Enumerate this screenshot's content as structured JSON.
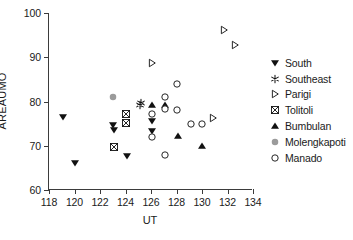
{
  "chart_data": {
    "type": "scatter",
    "title": "",
    "xlabel": "UT",
    "ylabel": "AREAUMO",
    "xlim": [
      118,
      134
    ],
    "ylim": [
      60,
      100
    ],
    "xticks": [
      118,
      120,
      122,
      124,
      126,
      128,
      130,
      132,
      134
    ],
    "yticks": [
      60,
      70,
      80,
      90,
      100
    ],
    "grid": false,
    "legend_position": "right",
    "series": [
      {
        "name": "South",
        "marker": "filled-triangle-down",
        "color": "#111111",
        "points": [
          {
            "x": 119.1,
            "y": 76.4
          },
          {
            "x": 120.0,
            "y": 66.0
          },
          {
            "x": 123.0,
            "y": 74.6
          },
          {
            "x": 123.1,
            "y": 73.6
          },
          {
            "x": 124.1,
            "y": 67.7
          },
          {
            "x": 126.1,
            "y": 75.6
          },
          {
            "x": 126.1,
            "y": 73.4
          }
        ]
      },
      {
        "name": "Southeast",
        "marker": "asterisk",
        "color": "#111111",
        "points": [
          {
            "x": 125.2,
            "y": 79.7
          },
          {
            "x": 125.1,
            "y": 79.1
          }
        ]
      },
      {
        "name": "Parigi",
        "marker": "open-triangle-right",
        "color": "#111111",
        "points": [
          {
            "x": 126.1,
            "y": 88.8
          },
          {
            "x": 130.9,
            "y": 76.3
          },
          {
            "x": 131.7,
            "y": 96.2
          },
          {
            "x": 132.6,
            "y": 92.8
          }
        ]
      },
      {
        "name": "Tolitoli",
        "marker": "crossed-square",
        "color": "#111111",
        "points": [
          {
            "x": 124.0,
            "y": 77.1
          },
          {
            "x": 124.0,
            "y": 75.1
          },
          {
            "x": 123.1,
            "y": 69.8
          }
        ]
      },
      {
        "name": "Bumbulan",
        "marker": "filled-triangle-up",
        "color": "#111111",
        "points": [
          {
            "x": 126.1,
            "y": 79.3
          },
          {
            "x": 127.1,
            "y": 79.2
          },
          {
            "x": 128.1,
            "y": 72.1
          },
          {
            "x": 130.0,
            "y": 70.0
          }
        ]
      },
      {
        "name": "Molengkapoti",
        "marker": "filled-circle-gray",
        "color": "#9b9b9b",
        "points": [
          {
            "x": 123.0,
            "y": 81.0
          }
        ]
      },
      {
        "name": "Manado",
        "marker": "open-circle",
        "color": "#111111",
        "points": [
          {
            "x": 126.1,
            "y": 77.2
          },
          {
            "x": 126.1,
            "y": 72.0
          },
          {
            "x": 127.1,
            "y": 81.0
          },
          {
            "x": 127.1,
            "y": 78.2
          },
          {
            "x": 127.1,
            "y": 68.0
          },
          {
            "x": 128.0,
            "y": 84.0
          },
          {
            "x": 128.0,
            "y": 78.0
          },
          {
            "x": 129.1,
            "y": 75.0
          },
          {
            "x": 130.0,
            "y": 75.0
          }
        ]
      }
    ]
  },
  "legend": {
    "items": [
      {
        "label": "South",
        "marker": "filled-triangle-down"
      },
      {
        "label": "Southeast",
        "marker": "asterisk"
      },
      {
        "label": "Parigi",
        "marker": "open-triangle-right"
      },
      {
        "label": "Tolitoli",
        "marker": "crossed-square"
      },
      {
        "label": "Bumbulan",
        "marker": "filled-triangle-up"
      },
      {
        "label": "Molengkapoti",
        "marker": "filled-circle-gray"
      },
      {
        "label": "Manado",
        "marker": "open-circle"
      }
    ]
  }
}
